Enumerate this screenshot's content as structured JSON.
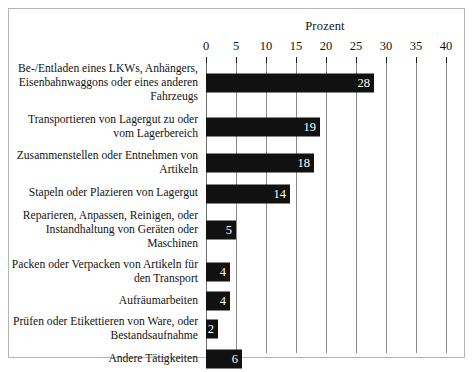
{
  "chart_data": {
    "type": "bar",
    "orientation": "horizontal",
    "title": "",
    "xlabel": "Prozent",
    "ylabel": "",
    "xlim": [
      0,
      40
    ],
    "xticks": [
      0,
      5,
      10,
      15,
      20,
      25,
      30,
      35,
      40
    ],
    "grid": true,
    "legend": null,
    "bar_color": "#111111",
    "value_label_color": "#ffffff",
    "categories": [
      "Be-/Entladen eines LKWs, Anhängers, Eisenbahnwaggons oder eines anderen Fahrzeugs",
      "Transportieren von Lagergut zu oder vom Lagerbereich",
      "Zusammenstellen oder Entnehmen von Artikeln",
      "Stapeln oder Plazieren von Lagergut",
      "Reparieren, Anpassen, Reinigen, oder Instandhaltung von Geräten oder Maschinen",
      "Packen oder Verpacken von Artikeln für den Transport",
      "Aufräumarbeiten",
      "Prüfen oder Etikettieren von Ware, oder Bestandsaufnahme",
      "Andere Tätigkeiten"
    ],
    "values": [
      28,
      19,
      18,
      14,
      5,
      4,
      4,
      2,
      6
    ]
  },
  "axis": {
    "title": "Prozent",
    "ticks": [
      "0",
      "5",
      "10",
      "15",
      "20",
      "25",
      "30",
      "35",
      "40"
    ]
  },
  "rows": [
    {
      "label": "Be-/Entladen eines LKWs, Anhängers, Eisenbahnwaggons oder eines anderen Fahrzeugs",
      "value": 28,
      "value_text": "28"
    },
    {
      "label": "Transportieren von Lagergut zu oder vom Lagerbereich",
      "value": 19,
      "value_text": "19"
    },
    {
      "label": "Zusammenstellen oder Entnehmen von Artikeln",
      "value": 18,
      "value_text": "18"
    },
    {
      "label": "Stapeln oder Plazieren von Lagergut",
      "value": 14,
      "value_text": "14"
    },
    {
      "label": "Reparieren, Anpassen, Reinigen, oder Instandhaltung von Geräten oder Maschinen",
      "value": 5,
      "value_text": "5"
    },
    {
      "label": "Packen oder Verpacken von Artikeln für den Transport",
      "value": 4,
      "value_text": "4"
    },
    {
      "label": "Aufräumarbeiten",
      "value": 4,
      "value_text": "4"
    },
    {
      "label": "Prüfen oder Etikettieren von Ware, oder Bestandsaufnahme",
      "value": 2,
      "value_text": "2"
    },
    {
      "label": "Andere Tätigkeiten",
      "value": 6,
      "value_text": "6"
    }
  ],
  "layout": {
    "plot_x0": 197,
    "px_per_unit": 6,
    "row_heights": [
      52,
      36,
      36,
      25,
      48,
      36,
      22,
      34,
      26
    ]
  }
}
